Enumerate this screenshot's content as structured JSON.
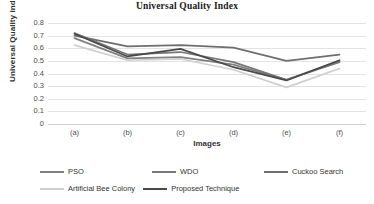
{
  "chart_data": {
    "type": "line",
    "title": "Universal Quality Index",
    "xlabel": "Images",
    "ylabel": "Universal Quality Index",
    "categories": [
      "(a)",
      "(b)",
      "(c)",
      "(d)",
      "(e)",
      "(f)"
    ],
    "ylim": [
      0,
      0.8
    ],
    "yticks": [
      "0",
      "0.1",
      "0.2",
      "0.3",
      "0.4",
      "0.5",
      "0.6",
      "0.7",
      "0.8"
    ],
    "ytick_values": [
      0,
      0.1,
      0.2,
      0.3,
      0.4,
      0.5,
      0.6,
      0.7,
      0.8
    ],
    "grid": true,
    "legend_position": "bottom",
    "series": [
      {
        "name": "PSO",
        "color": "#808080",
        "values": [
          0.68,
          0.52,
          0.53,
          0.47,
          0.35,
          0.5
        ]
      },
      {
        "name": "WDO",
        "color": "#777777",
        "values": [
          0.72,
          0.55,
          0.57,
          0.49,
          0.35,
          0.49
        ]
      },
      {
        "name": "Cuckoo Search",
        "color": "#6e6e6e",
        "values": [
          0.7,
          0.615,
          0.625,
          0.605,
          0.5,
          0.55
        ]
      },
      {
        "name": "Artificial Bee Colony",
        "color": "#cfcfcf",
        "values": [
          0.625,
          0.505,
          0.515,
          0.43,
          0.29,
          0.44
        ]
      },
      {
        "name": "Proposed Technique",
        "color": "#4a4a4a",
        "values": [
          0.715,
          0.535,
          0.595,
          0.45,
          0.345,
          0.505
        ]
      }
    ]
  },
  "legend": {
    "rows": [
      [
        "PSO",
        "WDO",
        "Cuckoo Search"
      ],
      [
        "Artificial Bee Colony",
        "Proposed Technique"
      ]
    ]
  }
}
